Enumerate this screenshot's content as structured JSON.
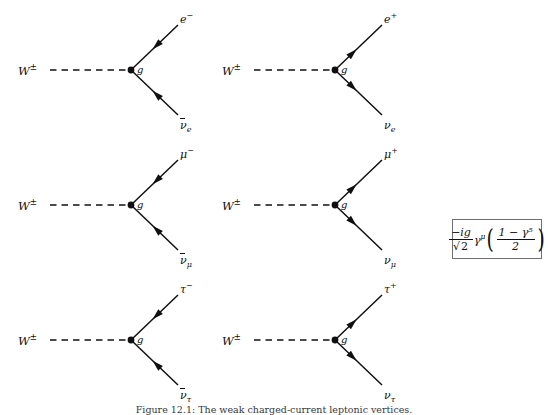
{
  "figure": {
    "caption_label": "Figure 12.1:",
    "caption_text": "The weak charged-current leptonic vertices.",
    "background": "#ffffff",
    "line_color": "#101010"
  },
  "vertex_factor": {
    "label": "vertex-factor",
    "prefactor_numerator": "−ig",
    "prefactor_denominator": "√2",
    "gamma": "γ",
    "gamma_index": "μ",
    "projector_numerator": "1 − γ⁵",
    "projector_denominator": "2",
    "full_text": "(−ig/√2) γ^μ ((1 − γ⁵)/2)",
    "border_color": "#6f6f6f"
  },
  "diagrams": [
    {
      "id": "w-to-electron-antineutrino",
      "row": 0,
      "column": 0,
      "boson_label": "W",
      "boson_superscript": "±",
      "coupling_label": "g",
      "arrow_direction": "inward",
      "upper_particle": {
        "symbol": "e",
        "superscript": "−",
        "subscript": "",
        "bar": false
      },
      "lower_particle": {
        "symbol": "ν",
        "superscript": "",
        "subscript": "e",
        "bar": true
      }
    },
    {
      "id": "w-to-positron-neutrino",
      "row": 0,
      "column": 1,
      "boson_label": "W",
      "boson_superscript": "±",
      "coupling_label": "g",
      "arrow_direction": "outward",
      "upper_particle": {
        "symbol": "e",
        "superscript": "+",
        "subscript": "",
        "bar": false
      },
      "lower_particle": {
        "symbol": "ν",
        "superscript": "",
        "subscript": "e",
        "bar": false
      }
    },
    {
      "id": "w-to-muon-antineutrino",
      "row": 1,
      "column": 0,
      "boson_label": "W",
      "boson_superscript": "±",
      "coupling_label": "g",
      "arrow_direction": "inward",
      "upper_particle": {
        "symbol": "μ",
        "superscript": "−",
        "subscript": "",
        "bar": false
      },
      "lower_particle": {
        "symbol": "ν",
        "superscript": "",
        "subscript": "μ",
        "bar": true
      }
    },
    {
      "id": "w-to-antimuon-neutrino",
      "row": 1,
      "column": 1,
      "boson_label": "W",
      "boson_superscript": "±",
      "coupling_label": "g",
      "arrow_direction": "outward",
      "upper_particle": {
        "symbol": "μ",
        "superscript": "+",
        "subscript": "",
        "bar": false
      },
      "lower_particle": {
        "symbol": "ν",
        "superscript": "",
        "subscript": "μ",
        "bar": false
      }
    },
    {
      "id": "w-to-tau-antineutrino",
      "row": 2,
      "column": 0,
      "boson_label": "W",
      "boson_superscript": "±",
      "coupling_label": "g",
      "arrow_direction": "inward",
      "upper_particle": {
        "symbol": "τ",
        "superscript": "−",
        "subscript": "",
        "bar": false
      },
      "lower_particle": {
        "symbol": "ν",
        "superscript": "",
        "subscript": "τ",
        "bar": true
      }
    },
    {
      "id": "w-to-antitau-neutrino",
      "row": 2,
      "column": 1,
      "boson_label": "W",
      "boson_superscript": "±",
      "coupling_label": "g",
      "arrow_direction": "outward",
      "upper_particle": {
        "symbol": "τ",
        "superscript": "+",
        "subscript": "",
        "bar": false
      },
      "lower_particle": {
        "symbol": "ν",
        "superscript": "",
        "subscript": "τ",
        "bar": false
      }
    }
  ]
}
